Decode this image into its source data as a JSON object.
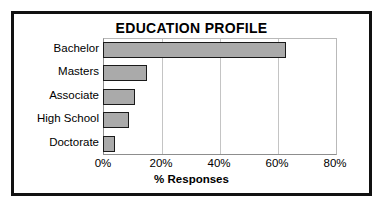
{
  "chart_data": {
    "type": "bar",
    "orientation": "horizontal",
    "title": "EDUCATION PROFILE",
    "xlabel": "% Responses",
    "ylabel": "",
    "categories": [
      "Bachelor",
      "Masters",
      "Associate",
      "High School",
      "Doctorate"
    ],
    "values": [
      63,
      15,
      11,
      9,
      4
    ],
    "xlim": [
      0,
      80
    ],
    "xticks": [
      0,
      20,
      40,
      60,
      80
    ],
    "xtick_labels": [
      "0%",
      "20%",
      "40%",
      "60%",
      "80%"
    ],
    "grid": "vertical",
    "legend": "none",
    "series": [
      {
        "name": "% Responses",
        "values": [
          63,
          15,
          11,
          9,
          4
        ]
      }
    ],
    "colors": {
      "bar_fill": "#aaaaaa",
      "bar_edge": "#1a1a1a",
      "grid": "#c4c4c4",
      "axis": "#8d8d8d",
      "frame": "#111111",
      "text": "#000000",
      "background": "#ffffff"
    }
  }
}
